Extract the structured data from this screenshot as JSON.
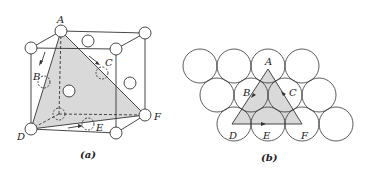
{
  "figure_a": {
    "caption": "(a)",
    "labels": {
      "A": "A",
      "B": "B",
      "C": "C",
      "D": "D",
      "E": "E",
      "F": "F"
    },
    "description": "FCC unit cell with shaded (111) close-packed plane ADF; arrows show slip directions"
  },
  "figure_b": {
    "caption": "(b)",
    "labels": {
      "A": "A",
      "B": "B",
      "C": "C",
      "D": "D",
      "E": "E",
      "F": "F"
    },
    "description": "Close-packed atom layer with triangle ADF marking the (111) plane"
  },
  "colors": {
    "shade": "#d9d9d9",
    "line": "#333333"
  }
}
